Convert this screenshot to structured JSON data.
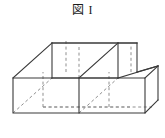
{
  "figure": {
    "title": "図 I",
    "caption_text": "図 I",
    "colors": {
      "background": "#ffffff",
      "visible_edge": "#3a3a3a",
      "hidden_edge": "#8f8f8f",
      "title_text": "#1a1a1a"
    },
    "geometry": {
      "projection": "oblique",
      "cube_count": 2,
      "dimensions_in_cubes": {
        "width": 2,
        "height": 1,
        "depth": 1
      },
      "unit_size_px": 66,
      "depth_offset_px": {
        "dx": 43,
        "dy": -38
      },
      "origin_px": {
        "x": 13,
        "y": 113
      },
      "front_face": {
        "bottom_left": {
          "x": 13,
          "y": 113
        },
        "bottom_right": {
          "x": 145,
          "y": 113
        },
        "top_left": {
          "x": 13,
          "y": 78
        },
        "top_right": {
          "x": 145,
          "y": 78
        }
      },
      "back_face": {
        "bottom_left": {
          "x": 56,
          "y": 75
        },
        "bottom_right": {
          "x": 188,
          "y": 75
        },
        "top_left": {
          "x": 56,
          "y": 40
        },
        "top_right": {
          "x": 188,
          "y": 40
        }
      },
      "divider_x_px": 79
    },
    "edges": {
      "visible_count": 11,
      "hidden_count": 9
    }
  }
}
